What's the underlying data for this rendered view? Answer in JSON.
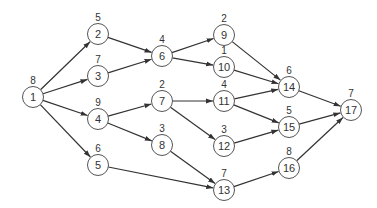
{
  "diagram": {
    "type": "directed-network",
    "node_radius": 10.5,
    "colors": {
      "stroke": "#555555",
      "edge": "#333333",
      "text": "#333333",
      "background": "#ffffff"
    },
    "nodes": [
      {
        "id": "1",
        "label": "1",
        "weight": "8",
        "x": 33,
        "y": 97
      },
      {
        "id": "2",
        "label": "2",
        "weight": "5",
        "x": 98,
        "y": 34
      },
      {
        "id": "3",
        "label": "3",
        "weight": "7",
        "x": 98,
        "y": 76
      },
      {
        "id": "4",
        "label": "4",
        "weight": "9",
        "x": 98,
        "y": 119
      },
      {
        "id": "5",
        "label": "5",
        "weight": "6",
        "x": 98,
        "y": 165
      },
      {
        "id": "6",
        "label": "6",
        "weight": "4",
        "x": 162,
        "y": 56
      },
      {
        "id": "7",
        "label": "7",
        "weight": "2",
        "x": 162,
        "y": 101
      },
      {
        "id": "8",
        "label": "8",
        "weight": "3",
        "x": 162,
        "y": 145
      },
      {
        "id": "9",
        "label": "9",
        "weight": "2",
        "x": 224,
        "y": 35
      },
      {
        "id": "10",
        "label": "10",
        "weight": "1",
        "x": 224,
        "y": 67
      },
      {
        "id": "11",
        "label": "11",
        "weight": "4",
        "x": 224,
        "y": 101
      },
      {
        "id": "12",
        "label": "12",
        "weight": "3",
        "x": 224,
        "y": 146
      },
      {
        "id": "13",
        "label": "13",
        "weight": "7",
        "x": 224,
        "y": 190
      },
      {
        "id": "14",
        "label": "14",
        "weight": "6",
        "x": 289,
        "y": 87
      },
      {
        "id": "15",
        "label": "15",
        "weight": "5",
        "x": 289,
        "y": 127
      },
      {
        "id": "16",
        "label": "16",
        "weight": "8",
        "x": 289,
        "y": 168
      },
      {
        "id": "17",
        "label": "17",
        "weight": "7",
        "x": 351,
        "y": 110
      }
    ],
    "edges": [
      {
        "from": "1",
        "to": "2"
      },
      {
        "from": "1",
        "to": "3"
      },
      {
        "from": "1",
        "to": "4"
      },
      {
        "from": "1",
        "to": "5"
      },
      {
        "from": "2",
        "to": "6"
      },
      {
        "from": "3",
        "to": "6"
      },
      {
        "from": "4",
        "to": "7"
      },
      {
        "from": "4",
        "to": "8"
      },
      {
        "from": "5",
        "to": "13"
      },
      {
        "from": "6",
        "to": "9"
      },
      {
        "from": "6",
        "to": "10"
      },
      {
        "from": "7",
        "to": "11"
      },
      {
        "from": "7",
        "to": "12"
      },
      {
        "from": "8",
        "to": "13"
      },
      {
        "from": "9",
        "to": "14"
      },
      {
        "from": "10",
        "to": "14"
      },
      {
        "from": "11",
        "to": "14"
      },
      {
        "from": "11",
        "to": "15"
      },
      {
        "from": "12",
        "to": "15"
      },
      {
        "from": "13",
        "to": "16"
      },
      {
        "from": "14",
        "to": "17"
      },
      {
        "from": "15",
        "to": "17"
      },
      {
        "from": "16",
        "to": "17"
      }
    ]
  }
}
